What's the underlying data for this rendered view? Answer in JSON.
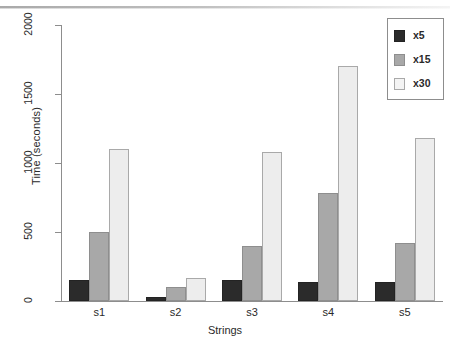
{
  "chart_data": {
    "type": "bar",
    "title": "",
    "xlabel": "Strings",
    "ylabel": "Time (seconds)",
    "categories": [
      "s1",
      "s2",
      "s3",
      "s4",
      "s5"
    ],
    "series": [
      {
        "name": "x5",
        "color": "#2b2b2b",
        "values": [
          150,
          30,
          150,
          140,
          140
        ]
      },
      {
        "name": "x15",
        "color": "#a8a8a8",
        "values": [
          500,
          100,
          400,
          780,
          420
        ]
      },
      {
        "name": "x30",
        "color": "#ededed",
        "values": [
          1100,
          170,
          1080,
          1700,
          1180
        ]
      }
    ],
    "ylim": [
      0,
      2000
    ],
    "yticks": [
      0,
      500,
      1000,
      1500,
      2000
    ],
    "ytick_labels": [
      "0",
      "500",
      "1000",
      "1500",
      "2000"
    ],
    "grid": false,
    "legend_position": "top-right",
    "legend_entries": [
      "x5",
      "x15",
      "x30"
    ]
  }
}
